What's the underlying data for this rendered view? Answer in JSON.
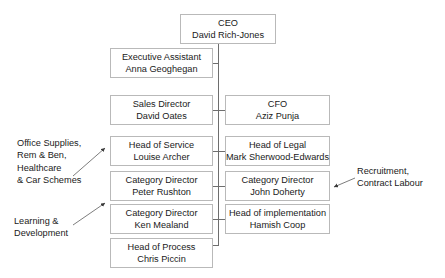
{
  "chart_title": "Organisational Chart",
  "nodes": {
    "ceo": {
      "role": "CEO",
      "person": "David Rich-Jones"
    },
    "exec_asst": {
      "role": "Executive Assistant",
      "person": "Anna Geoghegan"
    },
    "sales_dir": {
      "role": "Sales Director",
      "person": "David Oates"
    },
    "head_service": {
      "role": "Head of Service",
      "person": "Louise Archer"
    },
    "cat_dir_pr": {
      "role": "Category Director",
      "person": "Peter Rushton"
    },
    "cat_dir_km": {
      "role": "Category Director",
      "person": "Ken Mealand"
    },
    "head_process": {
      "role": "Head of Process",
      "person": "Chris Piccin"
    },
    "cfo": {
      "role": "CFO",
      "person": "Aziz Punja"
    },
    "head_legal": {
      "role": "Head of Legal",
      "person": "Mark Sherwood-Edwards"
    },
    "cat_dir_jd": {
      "role": "Category Director",
      "person": "John Doherty"
    },
    "head_impl": {
      "role": "Head of implementation",
      "person": "Hamish Coop"
    }
  },
  "annotations": {
    "office_supplies": "Office Supplies,\nRem & Ben,\nHealthcare\n& Car Schemes",
    "learning": "Learning &\nDevelopment",
    "recruitment": "Recruitment,\nContract Labour"
  },
  "colors": {
    "box_border": "#b9b9b9",
    "connector": "#6e6e6e",
    "text": "#1a1a1a",
    "background": "#ffffff"
  }
}
